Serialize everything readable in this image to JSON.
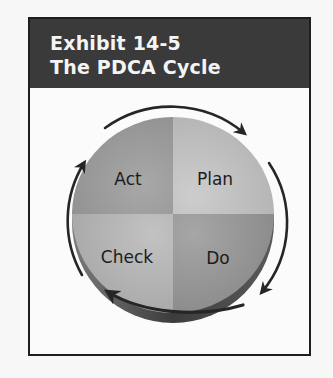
{
  "exhibit": {
    "number_label": "Exhibit 14-5",
    "title": "The PDCA Cycle"
  },
  "diagram": {
    "type": "cycle",
    "center": [
      173,
      215
    ],
    "quadrants": [
      {
        "position": "top-left",
        "label": "Act",
        "shade": "#9c9c9c"
      },
      {
        "position": "top-right",
        "label": "Plan",
        "shade": "#bdbdbd"
      },
      {
        "position": "bottom-right",
        "label": "Do",
        "shade": "#9a9a9a"
      },
      {
        "position": "bottom-left",
        "label": "Check",
        "shade": "#b4b4b4"
      }
    ],
    "flow_direction": "clockwise",
    "sequence": [
      "Plan",
      "Do",
      "Check",
      "Act"
    ],
    "colors": {
      "header_bg": "#3a3a3a",
      "header_text": "#f4f4f4",
      "arrow": "#262626",
      "rim": "#4a4a4a"
    }
  }
}
